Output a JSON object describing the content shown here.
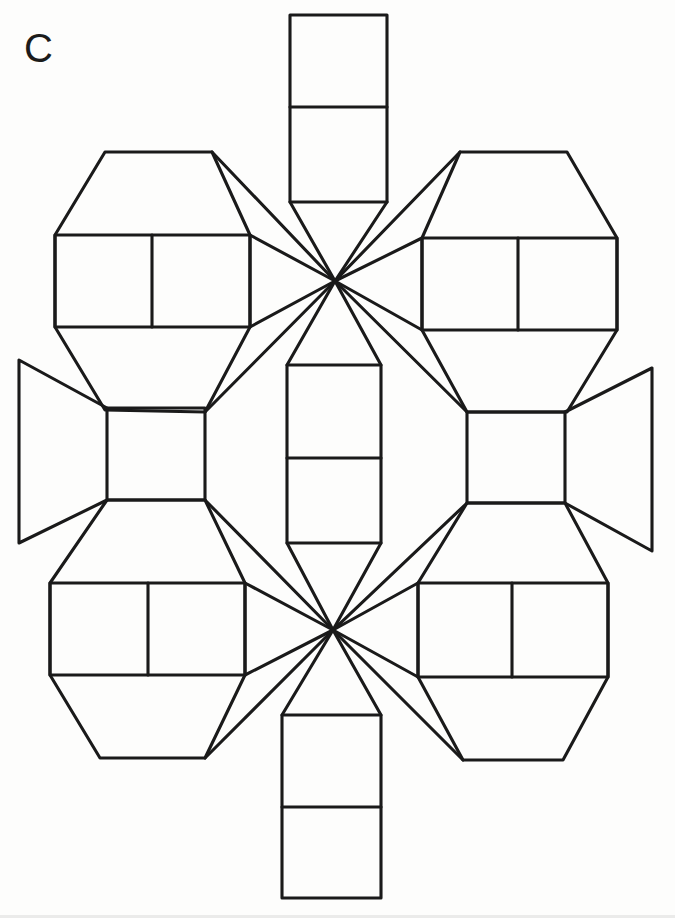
{
  "figure": {
    "label": "C",
    "background_color": "#ffffff",
    "line_color": "#1a1a1a",
    "line_width": 3.1,
    "canvas": {
      "width": 675,
      "height": 918
    }
  },
  "chart_data": {
    "type": "diagram",
    "subtype": "geometric-net",
    "title": "C",
    "vertices": {
      "star_top": [
        335,
        281
      ],
      "star_bottom": [
        333,
        630
      ]
    },
    "groups": [
      {
        "name": "top-strip",
        "kind": "rectangle-strip",
        "cells": 2,
        "outline": [
          [
            290,
            15
          ],
          [
            387,
            15
          ],
          [
            387,
            202
          ],
          [
            290,
            202
          ]
        ],
        "dividers": [
          [
            [
              290,
              107
            ],
            [
              387,
              107
            ]
          ]
        ]
      },
      {
        "name": "bottom-strip",
        "kind": "rectangle-strip",
        "cells": 2,
        "outline": [
          [
            282,
            715
          ],
          [
            381,
            715
          ],
          [
            381,
            898
          ],
          [
            282,
            898
          ]
        ],
        "dividers": [
          [
            [
              282,
              807
            ],
            [
              381,
              807
            ]
          ]
        ]
      },
      {
        "name": "center-strip",
        "kind": "rectangle-strip",
        "cells": 2,
        "outline": [
          [
            287,
            365
          ],
          [
            381,
            365
          ],
          [
            381,
            543
          ],
          [
            287,
            543
          ]
        ],
        "dividers": [
          [
            [
              287,
              458
            ],
            [
              381,
              458
            ]
          ]
        ]
      },
      {
        "name": "top-left-hexagon",
        "kind": "hexagon-with-rectangle",
        "outline": [
          [
            105,
            152
          ],
          [
            212,
            152
          ],
          [
            250,
            235
          ],
          [
            250,
            327
          ],
          [
            205,
            412
          ],
          [
            105,
            410
          ],
          [
            55,
            327
          ],
          [
            55,
            235
          ]
        ],
        "rectangle": [
          [
            55,
            235
          ],
          [
            250,
            235
          ],
          [
            250,
            327
          ],
          [
            55,
            327
          ]
        ],
        "dividers": [
          [
            [
              152,
              235
            ],
            [
              152,
              327
            ]
          ]
        ]
      },
      {
        "name": "top-right-hexagon",
        "kind": "hexagon-with-rectangle",
        "outline": [
          [
            460,
            152
          ],
          [
            567,
            152
          ],
          [
            617,
            238
          ],
          [
            617,
            330
          ],
          [
            567,
            412
          ],
          [
            467,
            412
          ],
          [
            422,
            330
          ],
          [
            422,
            238
          ]
        ],
        "rectangle": [
          [
            422,
            238
          ],
          [
            617,
            238
          ],
          [
            617,
            330
          ],
          [
            422,
            330
          ]
        ],
        "dividers": [
          [
            [
              518,
              238
            ],
            [
              518,
              330
            ]
          ]
        ]
      },
      {
        "name": "bottom-left-hexagon",
        "kind": "hexagon-with-rectangle",
        "outline": [
          [
            107,
            500
          ],
          [
            205,
            500
          ],
          [
            245,
            583
          ],
          [
            245,
            675
          ],
          [
            205,
            758
          ],
          [
            100,
            758
          ],
          [
            50,
            675
          ],
          [
            50,
            583
          ]
        ],
        "rectangle": [
          [
            50,
            583
          ],
          [
            245,
            583
          ],
          [
            245,
            675
          ],
          [
            50,
            675
          ]
        ],
        "dividers": [
          [
            [
              148,
              583
            ],
            [
              148,
              675
            ]
          ]
        ]
      },
      {
        "name": "bottom-right-hexagon",
        "kind": "hexagon-with-rectangle",
        "outline": [
          [
            467,
            503
          ],
          [
            565,
            503
          ],
          [
            608,
            583
          ],
          [
            608,
            677
          ],
          [
            563,
            760
          ],
          [
            463,
            760
          ],
          [
            418,
            677
          ],
          [
            418,
            583
          ]
        ],
        "rectangle": [
          [
            418,
            583
          ],
          [
            608,
            583
          ],
          [
            608,
            677
          ],
          [
            418,
            677
          ]
        ],
        "dividers": [
          [
            [
              512,
              583
            ],
            [
              512,
              677
            ]
          ]
        ]
      },
      {
        "name": "left-square",
        "kind": "square",
        "outline": [
          [
            107,
            408
          ],
          [
            205,
            408
          ],
          [
            205,
            500
          ],
          [
            107,
            500
          ]
        ]
      },
      {
        "name": "right-square",
        "kind": "square",
        "outline": [
          [
            467,
            412
          ],
          [
            565,
            412
          ],
          [
            565,
            503
          ],
          [
            467,
            503
          ]
        ]
      },
      {
        "name": "left-flap",
        "kind": "trapezoid-flap",
        "outline": [
          [
            107,
            408
          ],
          [
            19,
            360
          ],
          [
            19,
            543
          ],
          [
            107,
            500
          ]
        ]
      },
      {
        "name": "right-flap",
        "kind": "trapezoid-flap",
        "outline": [
          [
            565,
            412
          ],
          [
            652,
            368
          ],
          [
            652,
            551
          ],
          [
            565,
            503
          ]
        ]
      }
    ],
    "star_spokes_top": [
      [
        [
          212,
          152
        ],
        [
          335,
          281
        ]
      ],
      [
        [
          250,
          235
        ],
        [
          335,
          281
        ]
      ],
      [
        [
          250,
          327
        ],
        [
          335,
          281
        ]
      ],
      [
        [
          205,
          412
        ],
        [
          335,
          281
        ]
      ],
      [
        [
          290,
          202
        ],
        [
          335,
          281
        ]
      ],
      [
        [
          387,
          202
        ],
        [
          335,
          281
        ]
      ],
      [
        [
          460,
          152
        ],
        [
          335,
          281
        ]
      ],
      [
        [
          422,
          238
        ],
        [
          335,
          281
        ]
      ],
      [
        [
          422,
          330
        ],
        [
          335,
          281
        ]
      ],
      [
        [
          467,
          412
        ],
        [
          335,
          281
        ]
      ],
      [
        [
          287,
          365
        ],
        [
          335,
          281
        ]
      ],
      [
        [
          381,
          365
        ],
        [
          335,
          281
        ]
      ]
    ],
    "star_spokes_bottom": [
      [
        [
          205,
          500
        ],
        [
          333,
          630
        ]
      ],
      [
        [
          245,
          583
        ],
        [
          333,
          630
        ]
      ],
      [
        [
          245,
          675
        ],
        [
          333,
          630
        ]
      ],
      [
        [
          205,
          758
        ],
        [
          333,
          630
        ]
      ],
      [
        [
          287,
          543
        ],
        [
          333,
          630
        ]
      ],
      [
        [
          381,
          543
        ],
        [
          333,
          630
        ]
      ],
      [
        [
          467,
          503
        ],
        [
          333,
          630
        ]
      ],
      [
        [
          418,
          583
        ],
        [
          333,
          630
        ]
      ],
      [
        [
          418,
          677
        ],
        [
          333,
          630
        ]
      ],
      [
        [
          463,
          760
        ],
        [
          333,
          630
        ]
      ],
      [
        [
          282,
          715
        ],
        [
          333,
          630
        ]
      ],
      [
        [
          381,
          715
        ],
        [
          333,
          630
        ]
      ]
    ],
    "xlabel": "",
    "ylabel": "",
    "legend": [],
    "grid": false
  }
}
